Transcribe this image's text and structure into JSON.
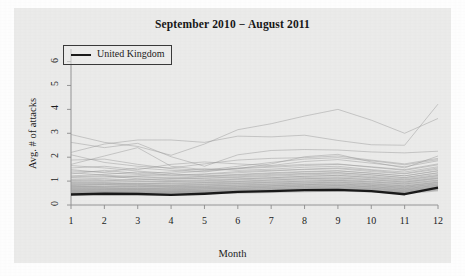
{
  "chart_data": {
    "type": "line",
    "title": "September 2010 − August 2011",
    "xlabel": "Month",
    "ylabel": "Avg. # of attacks",
    "xlim": [
      1,
      12
    ],
    "ylim": [
      0,
      6.4
    ],
    "x": [
      1,
      2,
      3,
      4,
      5,
      6,
      7,
      8,
      9,
      10,
      11,
      12
    ],
    "xticks": [
      "1",
      "2",
      "3",
      "4",
      "5",
      "6",
      "7",
      "8",
      "9",
      "10",
      "11",
      "12"
    ],
    "yticks": [
      "0",
      "1",
      "2",
      "3",
      "4",
      "5",
      "6"
    ],
    "grid": false,
    "legend": {
      "position": "top-left",
      "entries": [
        {
          "name": "United Kingdom",
          "color": "#1a1a1a",
          "linewidth": 2.4
        }
      ]
    },
    "highlight_series": {
      "name": "United Kingdom",
      "color": "#1a1a1a",
      "values": [
        0.44,
        0.47,
        0.46,
        0.42,
        0.47,
        0.55,
        0.58,
        0.62,
        0.63,
        0.58,
        0.45,
        0.73
      ]
    },
    "background_series_color": "#9a9a9a",
    "background_series_count": 46,
    "series": [
      {
        "name": "country-01",
        "values": [
          2.95,
          2.62,
          2.45,
          2.08,
          2.55,
          3.15,
          3.4,
          3.72,
          4.0,
          3.55,
          3.0,
          3.62
        ]
      },
      {
        "name": "country-02",
        "values": [
          2.2,
          2.55,
          2.72,
          2.72,
          2.62,
          2.88,
          2.85,
          2.92,
          2.7,
          2.52,
          2.5,
          4.22
        ]
      },
      {
        "name": "country-03",
        "values": [
          2.62,
          2.4,
          2.58,
          2.02,
          1.62,
          2.1,
          2.28,
          2.32,
          2.3,
          2.22,
          2.18,
          2.25
        ]
      },
      {
        "name": "country-04",
        "values": [
          1.7,
          2.05,
          2.4,
          1.62,
          1.48,
          1.52,
          1.72,
          2.02,
          2.12,
          1.8,
          1.55,
          2.05
        ]
      },
      {
        "name": "country-05",
        "values": [
          2.1,
          1.78,
          1.62,
          1.55,
          1.72,
          1.88,
          1.95,
          1.98,
          2.05,
          1.88,
          1.72,
          1.95
        ]
      },
      {
        "name": "country-06",
        "values": [
          1.55,
          1.62,
          1.48,
          1.7,
          1.8,
          1.72,
          1.65,
          1.82,
          1.9,
          1.75,
          1.6,
          1.85
        ]
      },
      {
        "name": "country-07",
        "values": [
          1.42,
          1.38,
          1.55,
          1.45,
          1.38,
          1.55,
          1.62,
          1.7,
          1.72,
          1.58,
          1.45,
          1.68
        ]
      },
      {
        "name": "country-08",
        "values": [
          1.3,
          1.45,
          1.32,
          1.38,
          1.52,
          1.45,
          1.5,
          1.58,
          1.62,
          1.48,
          1.38,
          1.6
        ]
      },
      {
        "name": "country-09",
        "values": [
          1.22,
          1.28,
          1.38,
          1.25,
          1.3,
          1.4,
          1.45,
          1.48,
          1.52,
          1.4,
          1.3,
          1.5
        ]
      },
      {
        "name": "country-10",
        "values": [
          1.15,
          1.18,
          1.22,
          1.3,
          1.22,
          1.28,
          1.35,
          1.4,
          1.44,
          1.32,
          1.22,
          1.42
        ]
      },
      {
        "name": "country-11",
        "values": [
          1.08,
          1.12,
          1.18,
          1.12,
          1.18,
          1.22,
          1.28,
          1.32,
          1.36,
          1.26,
          1.15,
          1.35
        ]
      },
      {
        "name": "country-12",
        "values": [
          1.02,
          1.08,
          1.04,
          1.1,
          1.12,
          1.15,
          1.2,
          1.26,
          1.3,
          1.2,
          1.1,
          1.28
        ]
      },
      {
        "name": "country-13",
        "values": [
          0.98,
          1.0,
          1.08,
          1.02,
          1.06,
          1.1,
          1.14,
          1.2,
          1.24,
          1.14,
          1.04,
          1.22
        ]
      },
      {
        "name": "country-14",
        "values": [
          0.94,
          0.96,
          0.98,
          1.0,
          1.0,
          1.05,
          1.1,
          1.15,
          1.18,
          1.1,
          1.0,
          1.18
        ]
      },
      {
        "name": "country-15",
        "values": [
          0.9,
          0.94,
          0.9,
          0.95,
          0.96,
          1.0,
          1.05,
          1.1,
          1.14,
          1.05,
          0.96,
          1.14
        ]
      },
      {
        "name": "country-16",
        "values": [
          0.86,
          0.88,
          0.92,
          0.88,
          0.92,
          0.96,
          1.0,
          1.05,
          1.08,
          1.0,
          0.92,
          1.1
        ]
      },
      {
        "name": "country-17",
        "values": [
          0.82,
          0.85,
          0.86,
          0.84,
          0.88,
          0.92,
          0.96,
          1.0,
          1.04,
          0.96,
          0.88,
          1.05
        ]
      },
      {
        "name": "country-18",
        "values": [
          0.8,
          0.8,
          0.83,
          0.8,
          0.84,
          0.88,
          0.92,
          0.96,
          1.0,
          0.92,
          0.84,
          1.0
        ]
      },
      {
        "name": "country-19",
        "values": [
          0.76,
          0.78,
          0.76,
          0.78,
          0.8,
          0.84,
          0.88,
          0.92,
          0.96,
          0.88,
          0.8,
          0.96
        ]
      },
      {
        "name": "country-20",
        "values": [
          0.74,
          0.74,
          0.78,
          0.74,
          0.77,
          0.8,
          0.84,
          0.88,
          0.92,
          0.85,
          0.77,
          0.93
        ]
      },
      {
        "name": "country-21",
        "values": [
          0.7,
          0.72,
          0.71,
          0.72,
          0.74,
          0.77,
          0.81,
          0.85,
          0.88,
          0.82,
          0.74,
          0.9
        ]
      },
      {
        "name": "country-22",
        "values": [
          0.68,
          0.68,
          0.7,
          0.68,
          0.71,
          0.74,
          0.78,
          0.82,
          0.85,
          0.78,
          0.71,
          0.86
        ]
      },
      {
        "name": "country-23",
        "values": [
          0.65,
          0.66,
          0.65,
          0.66,
          0.68,
          0.71,
          0.75,
          0.79,
          0.82,
          0.76,
          0.68,
          0.83
        ]
      },
      {
        "name": "country-24",
        "values": [
          0.62,
          0.63,
          0.64,
          0.63,
          0.66,
          0.68,
          0.72,
          0.76,
          0.79,
          0.73,
          0.65,
          0.8
        ]
      },
      {
        "name": "country-25",
        "values": [
          0.6,
          0.6,
          0.61,
          0.6,
          0.63,
          0.66,
          0.69,
          0.73,
          0.76,
          0.7,
          0.63,
          0.77
        ]
      },
      {
        "name": "country-26",
        "values": [
          0.58,
          0.58,
          0.59,
          0.58,
          0.6,
          0.63,
          0.66,
          0.7,
          0.73,
          0.68,
          0.6,
          0.74
        ]
      },
      {
        "name": "country-27",
        "values": [
          0.55,
          0.56,
          0.56,
          0.56,
          0.58,
          0.61,
          0.64,
          0.68,
          0.7,
          0.65,
          0.58,
          0.71
        ]
      },
      {
        "name": "country-28",
        "values": [
          0.53,
          0.54,
          0.54,
          0.54,
          0.56,
          0.58,
          0.61,
          0.65,
          0.68,
          0.62,
          0.55,
          0.69
        ]
      },
      {
        "name": "country-29",
        "values": [
          0.51,
          0.52,
          0.52,
          0.52,
          0.54,
          0.56,
          0.59,
          0.63,
          0.65,
          0.6,
          0.53,
          0.66
        ]
      },
      {
        "name": "country-30",
        "values": [
          0.49,
          0.5,
          0.5,
          0.5,
          0.52,
          0.54,
          0.57,
          0.6,
          0.63,
          0.58,
          0.51,
          0.64
        ]
      },
      {
        "name": "country-31",
        "values": [
          1.88,
          1.92,
          1.7,
          1.52,
          1.45,
          1.62,
          1.78,
          1.92,
          1.98,
          1.85,
          1.68,
          1.9
        ]
      },
      {
        "name": "country-32",
        "values": [
          1.65,
          1.55,
          1.42,
          1.32,
          1.42,
          1.52,
          1.58,
          1.65,
          1.7,
          1.6,
          1.48,
          1.72
        ]
      },
      {
        "name": "country-33",
        "values": [
          1.48,
          1.35,
          1.28,
          1.22,
          1.28,
          1.35,
          1.42,
          1.5,
          1.55,
          1.45,
          1.32,
          1.55
        ]
      },
      {
        "name": "country-34",
        "values": [
          1.35,
          1.25,
          1.18,
          1.16,
          1.2,
          1.26,
          1.32,
          1.38,
          1.42,
          1.34,
          1.22,
          1.44
        ]
      },
      {
        "name": "country-35",
        "values": [
          1.18,
          1.22,
          1.1,
          1.08,
          1.12,
          1.18,
          1.24,
          1.3,
          1.34,
          1.26,
          1.14,
          1.34
        ]
      },
      {
        "name": "country-36",
        "values": [
          1.05,
          1.02,
          1.0,
          0.98,
          1.02,
          1.08,
          1.14,
          1.2,
          1.24,
          1.16,
          1.06,
          1.24
        ]
      },
      {
        "name": "country-37",
        "values": [
          0.92,
          0.9,
          0.88,
          0.9,
          0.94,
          0.98,
          1.04,
          1.1,
          1.12,
          1.06,
          0.96,
          1.12
        ]
      },
      {
        "name": "country-38",
        "values": [
          0.84,
          0.86,
          0.82,
          0.82,
          0.86,
          0.9,
          0.95,
          1.0,
          1.03,
          0.97,
          0.88,
          1.03
        ]
      },
      {
        "name": "country-39",
        "values": [
          0.78,
          0.76,
          0.75,
          0.76,
          0.79,
          0.83,
          0.87,
          0.92,
          0.95,
          0.89,
          0.8,
          0.95
        ]
      },
      {
        "name": "country-40",
        "values": [
          0.72,
          0.7,
          0.69,
          0.7,
          0.73,
          0.76,
          0.8,
          0.85,
          0.88,
          0.82,
          0.74,
          0.88
        ]
      },
      {
        "name": "country-41",
        "values": [
          0.66,
          0.65,
          0.64,
          0.64,
          0.67,
          0.7,
          0.74,
          0.78,
          0.81,
          0.76,
          0.68,
          0.82
        ]
      },
      {
        "name": "country-42",
        "values": [
          0.6,
          0.59,
          0.58,
          0.59,
          0.61,
          0.64,
          0.68,
          0.72,
          0.75,
          0.7,
          0.62,
          0.76
        ]
      },
      {
        "name": "country-43",
        "values": [
          0.56,
          0.55,
          0.54,
          0.55,
          0.57,
          0.6,
          0.63,
          0.67,
          0.7,
          0.65,
          0.57,
          0.71
        ]
      },
      {
        "name": "country-44",
        "values": [
          0.52,
          0.51,
          0.51,
          0.51,
          0.53,
          0.56,
          0.59,
          0.63,
          0.66,
          0.61,
          0.54,
          0.67
        ]
      },
      {
        "name": "country-45",
        "values": [
          0.48,
          0.48,
          0.47,
          0.48,
          0.5,
          0.52,
          0.55,
          0.59,
          0.61,
          0.57,
          0.5,
          0.62
        ]
      },
      {
        "name": "country-46",
        "values": [
          0.46,
          0.45,
          0.45,
          0.45,
          0.47,
          0.49,
          0.52,
          0.55,
          0.58,
          0.54,
          0.47,
          0.59
        ]
      }
    ]
  }
}
